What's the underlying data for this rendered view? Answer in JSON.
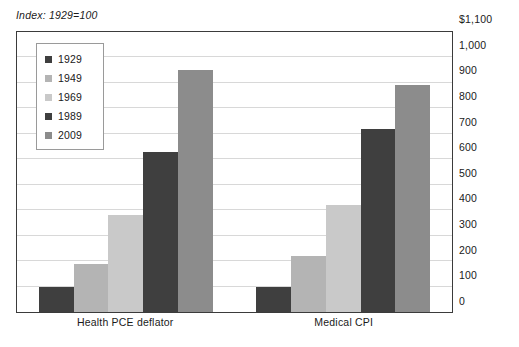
{
  "note": "Index: 1929=100",
  "legend": {
    "position": "top-left-inside",
    "entries": [
      {
        "label": "1929",
        "color": "#3f3f3f"
      },
      {
        "label": "1949",
        "color": "#b4b4b4"
      },
      {
        "label": "1969",
        "color": "#c9c9c9"
      },
      {
        "label": "1989",
        "color": "#3f3f3f"
      },
      {
        "label": "2009",
        "color": "#8c8c8c"
      }
    ]
  },
  "axis": {
    "y_ticks": [
      "0",
      "100",
      "200",
      "300",
      "400",
      "500",
      "600",
      "700",
      "800",
      "900",
      "1,000",
      "$1,100"
    ],
    "x_ticks": [
      "Health PCE deflator",
      "Medical CPI"
    ]
  },
  "chart_data": {
    "type": "bar",
    "title": "",
    "subtitle": "",
    "xlabel": "",
    "ylabel": "",
    "note": "Index: 1929=100",
    "ylim": [
      0,
      1100
    ],
    "ytick_step": 100,
    "grid": true,
    "legend_position": "top-left-inside",
    "categories": [
      "Health PCE deflator",
      "Medical CPI"
    ],
    "series": [
      {
        "name": "1929",
        "color": "#3f3f3f",
        "values": [
          100,
          100
        ]
      },
      {
        "name": "1949",
        "color": "#b4b4b4",
        "values": [
          190,
          220
        ]
      },
      {
        "name": "1969",
        "color": "#c9c9c9",
        "values": [
          380,
          420
        ]
      },
      {
        "name": "1989",
        "color": "#3f3f3f",
        "values": [
          630,
          720
        ]
      },
      {
        "name": "2009",
        "color": "#8c8c8c",
        "values": [
          950,
          890
        ]
      }
    ]
  }
}
